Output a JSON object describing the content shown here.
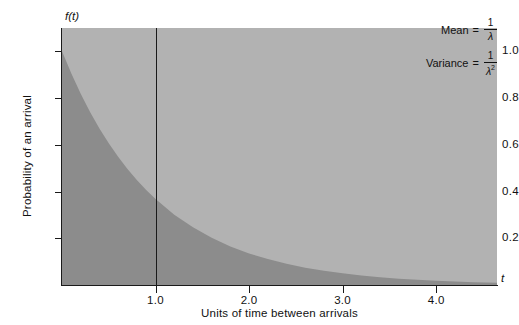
{
  "chart_data": {
    "type": "area",
    "title": "",
    "xlabel": "Units of time between arrivals",
    "ylabel": "Probability of an arrival",
    "x_axis_symbol": "t",
    "y_axis_symbol": "f(t)",
    "xlim": [
      0,
      4.65
    ],
    "ylim": [
      0,
      1.1
    ],
    "grid": false,
    "x_ticks": [
      {
        "value": 1.0,
        "label": "1.0"
      },
      {
        "value": 2.0,
        "label": "2.0"
      },
      {
        "value": 3.0,
        "label": "3.0"
      },
      {
        "value": 4.0,
        "label": "4.0"
      }
    ],
    "y_ticks": [
      {
        "value": 1.0,
        "label": "1.0"
      },
      {
        "value": 0.8,
        "label": "0.8"
      },
      {
        "value": 0.6,
        "label": "0.6"
      },
      {
        "value": 0.4,
        "label": "0.4"
      },
      {
        "value": 0.2,
        "label": "0.2"
      }
    ],
    "series": [
      {
        "name": "exponential pdf (lambda = 1)",
        "function": "f(t) = e^(-t)",
        "x": [
          0.0,
          0.1,
          0.2,
          0.3,
          0.4,
          0.5,
          0.6,
          0.7,
          0.8,
          0.9,
          1.0,
          1.2,
          1.4,
          1.6,
          1.8,
          2.0,
          2.2,
          2.4,
          2.6,
          2.8,
          3.0,
          3.2,
          3.4,
          3.6,
          3.8,
          4.0,
          4.2,
          4.4,
          4.65
        ],
        "values": [
          1.0,
          0.905,
          0.819,
          0.741,
          0.67,
          0.607,
          0.549,
          0.497,
          0.449,
          0.407,
          0.368,
          0.301,
          0.247,
          0.202,
          0.165,
          0.135,
          0.111,
          0.091,
          0.074,
          0.061,
          0.05,
          0.041,
          0.033,
          0.027,
          0.022,
          0.018,
          0.015,
          0.012,
          0.01
        ]
      }
    ],
    "markers": [
      {
        "name": "vertical-line-at-one",
        "x": 1.0,
        "label": ""
      }
    ],
    "annotations": [
      {
        "name": "mean",
        "label": "Mean",
        "equals": "=",
        "numerator": "1",
        "denominator": "λ",
        "exponent": ""
      },
      {
        "name": "variance",
        "label": "Variance",
        "equals": "=",
        "numerator": "1",
        "denominator": "λ",
        "exponent": "2"
      }
    ],
    "colors": {
      "plot_background": "#b2b2b2",
      "area_fill": "#8c8c8c",
      "axis": "#1a1a1a",
      "page_background": "#ffffff",
      "text": "#111111"
    }
  }
}
